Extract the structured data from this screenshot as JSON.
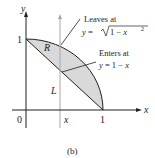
{
  "diagram": {
    "caption": "(b)",
    "axes": {
      "x_label": "x",
      "y_label": "y",
      "origin_label": "0",
      "x_tick": "1",
      "y_tick": "1",
      "x_marker_label": "x"
    },
    "region_label": "R",
    "line_label": "L",
    "annotations": {
      "leaves": {
        "line1": "Leaves at",
        "line2_prefix": "y = ",
        "line2_expr": "1 − x",
        "exponent": "2"
      },
      "enters": {
        "line1": "Enters at",
        "line2": "y = 1 − x"
      }
    },
    "colors": {
      "region_fill": "#d9d9d9",
      "line": "#231f20",
      "vertical_line": "#a6a6a6"
    }
  }
}
